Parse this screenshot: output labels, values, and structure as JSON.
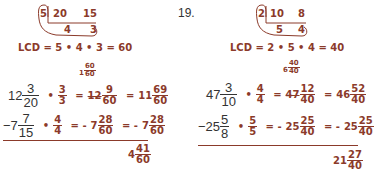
{
  "colors": {
    "print": "#333333",
    "hand": "#8b3a2a"
  },
  "left": {
    "division": {
      "divisor": "5",
      "top": [
        "20",
        "15"
      ],
      "quotients": [
        "4",
        "3"
      ]
    },
    "lcd_line": "LCD = 5 • 4 • 3 = 60",
    "borrow": {
      "whole": "1",
      "num": "60",
      "den": "60"
    },
    "row1": {
      "whole": "12",
      "num": "3",
      "den": "20",
      "op": "•",
      "mnum": "3",
      "mden": "3",
      "eq1": "=",
      "r_whole": "12",
      "r_num": "9",
      "r_den": "60",
      "eq2": "=",
      "f_whole": "11",
      "f_num": "69",
      "f_den": "60"
    },
    "row2": {
      "sign": "−",
      "whole": "7",
      "num": "7",
      "den": "15",
      "op": "•",
      "mnum": "4",
      "mden": "4",
      "eq1": "= -",
      "r_whole": "7",
      "r_num": "28",
      "r_den": "60",
      "eq2": "= -",
      "f_whole": "7",
      "f_num": "28",
      "f_den": "60"
    },
    "result": {
      "whole": "4",
      "num": "41",
      "den": "60"
    }
  },
  "right": {
    "problem_number": "19.",
    "division": {
      "divisor": "2",
      "top": [
        "10",
        "8"
      ],
      "quotients": [
        "5",
        "4"
      ]
    },
    "lcd_line": "LCD = 2 • 5 • 4 = 40",
    "borrow": {
      "whole": "6",
      "num": "40",
      "den": "40"
    },
    "row1": {
      "whole": "47",
      "num": "3",
      "den": "10",
      "op": "•",
      "mnum": "4",
      "mden": "4",
      "eq1": "=",
      "r_whole": "47",
      "r_num": "12",
      "r_den": "40",
      "eq2": "=",
      "f_whole": "46",
      "f_num": "52",
      "f_den": "40"
    },
    "row2": {
      "sign": "−",
      "whole": "25",
      "num": "5",
      "den": "8",
      "op": "•",
      "mnum": "5",
      "mden": "5",
      "eq1": "= -",
      "r_whole": "25",
      "r_num": "25",
      "r_den": "40",
      "eq2": "= -",
      "f_whole": "25",
      "f_num": "25",
      "f_den": "40"
    },
    "result": {
      "whole": "21",
      "num": "27",
      "den": "40"
    }
  }
}
